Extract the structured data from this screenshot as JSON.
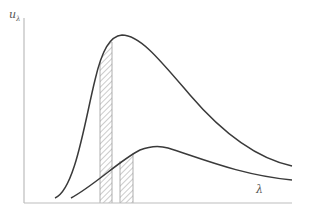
{
  "figure": {
    "type": "spectral-distribution-diagram",
    "y_axis_label": "u",
    "y_axis_subscript": "λ",
    "x_axis_label": "λ",
    "colors": {
      "curve": "#3a3a3a",
      "axis": "#bdbdbd",
      "hatch": "#9a9a9a",
      "label": "#555555"
    },
    "curves": [
      {
        "name": "higher-temperature-curve",
        "description": "tall peaked curve"
      },
      {
        "name": "lower-temperature-curve",
        "description": "low broad curve"
      }
    ],
    "hatched_strips": [
      {
        "name": "strip-under-tall-curve",
        "x_from": 100,
        "x_to": 112
      },
      {
        "name": "strip-under-low-curve",
        "x_from": 120,
        "x_to": 133
      }
    ]
  }
}
